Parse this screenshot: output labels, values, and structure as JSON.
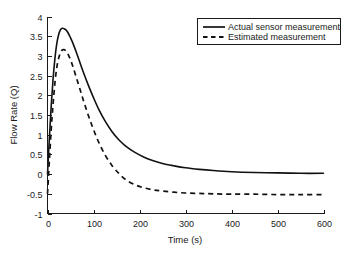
{
  "chart_data": {
    "type": "line",
    "title": "",
    "xlabel": "Time (s)",
    "ylabel": "Flow Rate (Q)",
    "xlim": [
      0,
      600
    ],
    "ylim": [
      -1,
      4
    ],
    "xticks": [
      0,
      100,
      200,
      300,
      400,
      500,
      600
    ],
    "xtick_labels": [
      "0",
      "100",
      "200",
      "300",
      "400",
      "500",
      "600"
    ],
    "yticks": [
      -1,
      -0.5,
      0,
      0.5,
      1,
      1.5,
      2,
      2.5,
      3,
      3.5,
      4
    ],
    "ytick_labels": [
      "-1",
      "-0.5",
      "0",
      "0.5",
      "1",
      "1.5",
      "2",
      "2.5",
      "3",
      "3.5",
      "4"
    ],
    "grid": false,
    "legend_position": "upper right",
    "series": [
      {
        "name": "Actual sensor measurement",
        "style": "solid",
        "color": "#111111",
        "x": [
          0,
          4,
          8,
          12,
          16,
          20,
          24,
          28,
          32,
          36,
          40,
          44,
          50,
          56,
          64,
          72,
          80,
          90,
          100,
          112,
          125,
          140,
          155,
          170,
          190,
          210,
          230,
          250,
          275,
          300,
          330,
          360,
          400,
          450,
          500,
          550,
          600
        ],
        "y": [
          0.0,
          0.9,
          1.72,
          2.4,
          2.92,
          3.3,
          3.53,
          3.66,
          3.7,
          3.69,
          3.66,
          3.6,
          3.46,
          3.3,
          3.05,
          2.78,
          2.52,
          2.22,
          1.94,
          1.63,
          1.35,
          1.08,
          0.87,
          0.71,
          0.55,
          0.43,
          0.34,
          0.27,
          0.21,
          0.16,
          0.12,
          0.09,
          0.06,
          0.04,
          0.03,
          0.02,
          0.02
        ]
      },
      {
        "name": "Estimated measurement",
        "style": "dashed",
        "color": "#111111",
        "x": [
          0,
          4,
          8,
          12,
          16,
          20,
          24,
          28,
          32,
          36,
          40,
          44,
          50,
          56,
          64,
          72,
          80,
          90,
          100,
          112,
          125,
          140,
          155,
          170,
          190,
          210,
          230,
          250,
          275,
          300,
          330,
          360,
          400,
          450,
          500,
          550,
          600
        ],
        "y": [
          -0.5,
          0.32,
          1.12,
          1.76,
          2.3,
          2.69,
          2.93,
          3.08,
          3.15,
          3.16,
          3.13,
          3.06,
          2.9,
          2.7,
          2.4,
          2.1,
          1.8,
          1.45,
          1.13,
          0.79,
          0.49,
          0.22,
          0.02,
          -0.14,
          -0.27,
          -0.35,
          -0.4,
          -0.43,
          -0.46,
          -0.48,
          -0.49,
          -0.5,
          -0.51,
          -0.51,
          -0.52,
          -0.52,
          -0.52
        ]
      }
    ],
    "annotations": []
  },
  "legend": {
    "entries": [
      {
        "label": "Actual sensor measurement",
        "style": "solid"
      },
      {
        "label": "Estimated measurement",
        "style": "dashed"
      }
    ]
  }
}
